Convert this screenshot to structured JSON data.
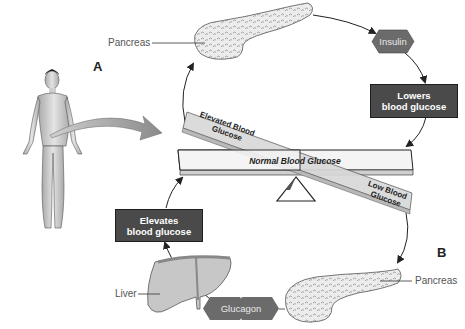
{
  "diagram": {
    "title_hint": "Blood glucose regulation (homeostasis) seesaw",
    "labels": {
      "panel_a": "A",
      "panel_b": "B",
      "pancreas_top": "Pancreas",
      "pancreas_bottom": "Pancreas",
      "liver": "Liver"
    },
    "hormones": {
      "insulin": "Insulin",
      "glucagon": "Glucagon"
    },
    "effects": {
      "lowers_line1": "Lowers",
      "lowers_line2": "blood glucose",
      "elevates_line1": "Elevates",
      "elevates_line2": "blood glucose"
    },
    "seesaw": {
      "normal": "Normal Blood Glucose",
      "elevated_line1": "Elevated Blood",
      "elevated_line2": "Glucose",
      "low_line1": "Low Blood",
      "low_line2": "Glucose"
    },
    "colors": {
      "box_fill": "#4a4a4a",
      "hex_fill": "#6b6b6b",
      "beam_light": "#f2f2f2",
      "tilted_beam": "#d6d6d6",
      "arrow_gray": "#8a8a8a",
      "line": "#222222"
    }
  }
}
